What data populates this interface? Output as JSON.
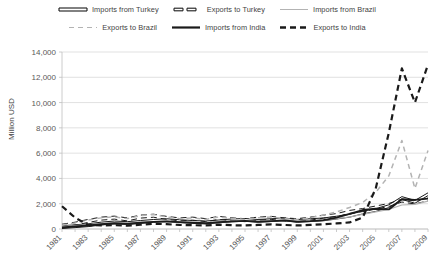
{
  "legend": {
    "rows": [
      [
        {
          "label": "Imports from Turkey",
          "style": "double-band",
          "color": "#1a1a1a"
        },
        {
          "label": "Exports to Turkey",
          "style": "thick-dash-hollow",
          "color": "#1a1a1a"
        },
        {
          "label": "Imports from Brazil",
          "style": "thin-solid",
          "color": "#b3b3b3"
        }
      ],
      [
        {
          "label": "Exports to Brazil",
          "style": "thin-dash",
          "color": "#b3b3b3"
        },
        {
          "label": "Imports from India",
          "style": "thick-solid",
          "color": "#1a1a1a"
        },
        {
          "label": "Exports to India",
          "style": "thick-dash",
          "color": "#1a1a1a"
        }
      ]
    ]
  },
  "chart_data": {
    "type": "line",
    "title": "",
    "xlabel": "",
    "ylabel": "Million USD",
    "ylim": [
      0,
      14000
    ],
    "ytick_values": [
      0,
      2000,
      4000,
      6000,
      8000,
      10000,
      12000,
      14000
    ],
    "ytick_labels": [
      "0",
      "2,000",
      "4,000",
      "6,000",
      "8,000",
      "10,000",
      "12,000",
      "14,000"
    ],
    "grid": true,
    "legend_position": "top",
    "x": [
      1981,
      1982,
      1983,
      1984,
      1985,
      1986,
      1987,
      1988,
      1989,
      1990,
      1991,
      1992,
      1993,
      1994,
      1995,
      1996,
      1997,
      1998,
      1999,
      2000,
      2001,
      2002,
      2003,
      2004,
      2005,
      2006,
      2007,
      2008,
      2009
    ],
    "xtick_labels": [
      "1981",
      "1983",
      "1985",
      "1987",
      "1989",
      "1991",
      "1993",
      "1995",
      "1997",
      "1999",
      "2001",
      "2003",
      "2005",
      "2007",
      "2009"
    ],
    "xtick_step": 2,
    "series": [
      {
        "name": "Imports from Turkey",
        "style": "double-band",
        "color": "#1a1a1a",
        "values": [
          150,
          220,
          300,
          430,
          520,
          470,
          560,
          640,
          700,
          620,
          560,
          520,
          600,
          680,
          720,
          640,
          700,
          760,
          640,
          700,
          760,
          900,
          1050,
          1300,
          1500,
          1800,
          2450,
          2150,
          2750
        ]
      },
      {
        "name": "Exports to Turkey",
        "style": "thick-dash-hollow",
        "color": "#1a1a1a",
        "values": [
          260,
          420,
          640,
          820,
          900,
          760,
          980,
          1050,
          880,
          760,
          820,
          700,
          880,
          760,
          700,
          820,
          880,
          760,
          700,
          820,
          980,
          1100,
          1350,
          1500,
          1700,
          1900,
          2250,
          2100,
          2350
        ]
      },
      {
        "name": "Imports from Brazil",
        "style": "thin-solid",
        "color": "#b3b3b3",
        "values": [
          180,
          260,
          340,
          420,
          480,
          430,
          520,
          580,
          620,
          560,
          520,
          480,
          560,
          620,
          660,
          600,
          640,
          700,
          600,
          640,
          700,
          820,
          950,
          1150,
          1350,
          1550,
          1900,
          1950,
          2200
        ]
      },
      {
        "name": "Exports to Brazil",
        "style": "thin-dash",
        "color": "#b3b3b3",
        "values": [
          300,
          480,
          700,
          880,
          960,
          820,
          1050,
          1150,
          950,
          820,
          880,
          760,
          950,
          820,
          760,
          880,
          950,
          820,
          760,
          880,
          1100,
          1350,
          1700,
          2100,
          2900,
          4200,
          7000,
          3200,
          6200
        ]
      },
      {
        "name": "Imports from India",
        "style": "thick-solid",
        "color": "#1a1a1a",
        "values": [
          120,
          200,
          280,
          380,
          460,
          420,
          500,
          560,
          600,
          540,
          500,
          460,
          540,
          600,
          640,
          580,
          620,
          680,
          580,
          620,
          700,
          900,
          1200,
          1500,
          1600,
          1550,
          2350,
          2300,
          2400
        ]
      },
      {
        "name": "Exports to India",
        "style": "thick-dash",
        "color": "#1a1a1a",
        "values": [
          1800,
          900,
          320,
          280,
          300,
          260,
          340,
          420,
          380,
          320,
          300,
          280,
          340,
          300,
          280,
          320,
          360,
          320,
          280,
          320,
          380,
          440,
          520,
          900,
          3200,
          7600,
          12700,
          10000,
          13000
        ]
      }
    ]
  }
}
